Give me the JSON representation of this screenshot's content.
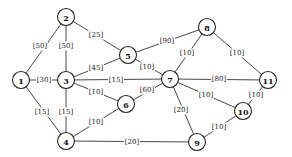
{
  "diagram": {
    "type": "weighted-undirected-graph",
    "nodes": [
      {
        "id": "1",
        "label": "1",
        "x": 21,
        "y": 80
      },
      {
        "id": "2",
        "label": "2",
        "x": 66,
        "y": 17
      },
      {
        "id": "3",
        "label": "3",
        "x": 66,
        "y": 80
      },
      {
        "id": "4",
        "label": "4",
        "x": 66,
        "y": 141
      },
      {
        "id": "5",
        "label": "5",
        "x": 128,
        "y": 55
      },
      {
        "id": "6",
        "label": "6",
        "x": 126,
        "y": 104
      },
      {
        "id": "7",
        "label": "7",
        "x": 170,
        "y": 79
      },
      {
        "id": "8",
        "label": "8",
        "x": 207,
        "y": 27
      },
      {
        "id": "9",
        "label": "9",
        "x": 197,
        "y": 142
      },
      {
        "id": "10",
        "label": "10",
        "x": 243,
        "y": 111
      },
      {
        "id": "11",
        "label": "11",
        "x": 268,
        "y": 80
      }
    ],
    "edges": [
      {
        "from": "1",
        "to": "2",
        "weight": "[50]",
        "lx": 40,
        "ly": 46
      },
      {
        "from": "2",
        "to": "3",
        "weight": "[50]",
        "lx": 66,
        "ly": 46
      },
      {
        "from": "2",
        "to": "5",
        "weight": "[25]",
        "lx": 96,
        "ly": 35
      },
      {
        "from": "1",
        "to": "3",
        "weight": "[30]",
        "lx": 44,
        "ly": 80
      },
      {
        "from": "3",
        "to": "5",
        "weight": "[45]",
        "lx": 96,
        "ly": 68
      },
      {
        "from": "3",
        "to": "7",
        "weight": "[15]",
        "lx": 116,
        "ly": 80
      },
      {
        "from": "3",
        "to": "6",
        "weight": "[10]",
        "lx": 96,
        "ly": 92
      },
      {
        "from": "1",
        "to": "4",
        "weight": "[15]",
        "lx": 42,
        "ly": 112
      },
      {
        "from": "3",
        "to": "4",
        "weight": "[15]",
        "lx": 66,
        "ly": 112
      },
      {
        "from": "4",
        "to": "6",
        "weight": "[10]",
        "lx": 96,
        "ly": 122
      },
      {
        "from": "4",
        "to": "9",
        "weight": "[20]",
        "lx": 132,
        "ly": 142
      },
      {
        "from": "5",
        "to": "7",
        "weight": "[10]",
        "lx": 147,
        "ly": 67
      },
      {
        "from": "5",
        "to": "8",
        "weight": "[90]",
        "lx": 167,
        "ly": 41
      },
      {
        "from": "6",
        "to": "7",
        "weight": "[60]",
        "lx": 147,
        "ly": 90
      },
      {
        "from": "7",
        "to": "8",
        "weight": "[10]",
        "lx": 187,
        "ly": 53
      },
      {
        "from": "8",
        "to": "11",
        "weight": "[10]",
        "lx": 237,
        "ly": 53
      },
      {
        "from": "7",
        "to": "11",
        "weight": "[80]",
        "lx": 219,
        "ly": 79
      },
      {
        "from": "7",
        "to": "10",
        "weight": "[10]",
        "lx": 206,
        "ly": 95
      },
      {
        "from": "7",
        "to": "9",
        "weight": "[20]",
        "lx": 181,
        "ly": 110
      },
      {
        "from": "10",
        "to": "11",
        "weight": "[10]",
        "lx": 256,
        "ly": 95
      },
      {
        "from": "9",
        "to": "10",
        "weight": "[10]",
        "lx": 219,
        "ly": 127
      }
    ]
  }
}
